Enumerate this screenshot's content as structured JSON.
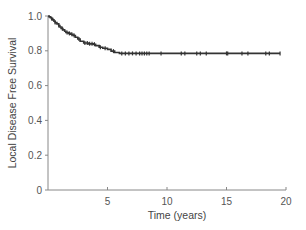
{
  "chart_data": {
    "type": "line",
    "subtype": "kaplan-meier step curve with censor marks",
    "title": "",
    "xlabel": "Time (years)",
    "ylabel": "Local Disease Free Survival",
    "xlim": [
      0,
      20
    ],
    "ylim": [
      0,
      1.0
    ],
    "x_ticks": [
      5,
      10,
      15,
      20
    ],
    "x_tick_labels": [
      "5",
      "10",
      "15",
      "20"
    ],
    "y_ticks": [
      0,
      0.2,
      0.4,
      0.6,
      0.8,
      1.0
    ],
    "y_tick_labels": [
      "0",
      "0.2",
      "0.4",
      "0.6",
      "0.8",
      "1.0"
    ],
    "grid": false,
    "legend": null,
    "series": [
      {
        "name": "Local Disease Free Survival",
        "color": "#333333",
        "x": [
          0,
          0.1,
          0.2,
          0.3,
          0.4,
          0.5,
          0.6,
          0.75,
          0.9,
          1.0,
          1.1,
          1.25,
          1.4,
          1.5,
          1.7,
          1.9,
          2.1,
          2.3,
          2.5,
          2.7,
          3.0,
          3.4,
          3.8,
          4.0,
          4.3,
          4.6,
          5.0,
          5.3,
          5.6,
          6.0,
          8.0,
          10.0,
          12.0,
          14.0,
          16.0,
          18.0,
          19.5
        ],
        "values": [
          1.0,
          0.995,
          0.99,
          0.985,
          0.978,
          0.97,
          0.962,
          0.955,
          0.945,
          0.937,
          0.928,
          0.92,
          0.912,
          0.905,
          0.9,
          0.895,
          0.888,
          0.878,
          0.868,
          0.855,
          0.845,
          0.84,
          0.838,
          0.83,
          0.82,
          0.815,
          0.808,
          0.798,
          0.79,
          0.785,
          0.785,
          0.785,
          0.785,
          0.785,
          0.785,
          0.785,
          0.785
        ]
      }
    ],
    "censor_times": [
      0.3,
      0.6,
      0.9,
      1.2,
      1.6,
      1.8,
      2.0,
      2.2,
      2.6,
      3.1,
      3.3,
      3.5,
      3.7,
      3.9,
      4.4,
      4.8,
      5.5,
      6.2,
      6.5,
      6.8,
      7.1,
      7.4,
      7.7,
      7.9,
      8.1,
      8.3,
      8.5,
      9.5,
      11.2,
      11.5,
      12.5,
      12.8,
      13.3,
      15.0,
      15.1,
      16.3,
      16.8,
      18.3,
      18.6,
      19.5
    ]
  }
}
